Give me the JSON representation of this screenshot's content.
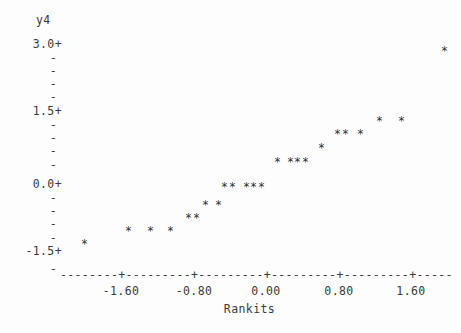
{
  "plot": {
    "type": "character-scatter",
    "marker_glyph": "*",
    "background_color": "#fdfdfd",
    "text_color": "#3a3a3a"
  },
  "y_axis": {
    "title": "y4",
    "major_labels": [
      "3.0+",
      "1.5+",
      "0.0+",
      "-1.5+"
    ],
    "minor_glyph": "-",
    "range": [
      -1.8,
      3.0
    ],
    "major_values": [
      3.0,
      1.5,
      0.0,
      -1.5
    ]
  },
  "x_axis": {
    "title": "Rankits",
    "tick_labels": [
      "-1.60",
      "-0.80",
      "0.00",
      "0.80",
      "1.60"
    ],
    "tick_values": [
      -1.6,
      -0.8,
      0.0,
      0.8,
      1.6
    ],
    "axis_line": "--------+---------+---------+---------+---------+-----",
    "range": [
      -2.27,
      1.95
    ]
  },
  "chart_data": {
    "type": "scatter",
    "title": "",
    "subtitle": "",
    "xlabel": "Rankits",
    "ylabel": "y4",
    "xlim": [
      -2.27,
      1.95
    ],
    "ylim": [
      -1.8,
      3.0
    ],
    "grid": false,
    "legend": "none",
    "xtick_labels": [
      "-1.60",
      "-0.80",
      "0.00",
      "0.80",
      "1.60"
    ],
    "ytick_labels": [
      "3.0+",
      "1.5+",
      "0.0+",
      "-1.5+"
    ],
    "n_points": 20,
    "series": [
      {
        "name": "y4 vs Rankits",
        "marker": "*",
        "points": [
          {
            "x": -2.01,
            "y": -1.52,
            "px": 84,
            "py": 245
          },
          {
            "x": -1.52,
            "y": -1.23,
            "px": 128,
            "py": 232
          },
          {
            "x": -1.28,
            "y": -1.23,
            "px": 150,
            "py": 232
          },
          {
            "x": -1.06,
            "y": -1.23,
            "px": 170,
            "py": 232
          },
          {
            "x": -0.86,
            "y": -0.93,
            "px": 188,
            "py": 219
          },
          {
            "x": -0.77,
            "y": -0.93,
            "px": 196,
            "py": 219
          },
          {
            "x": -0.67,
            "y": -0.63,
            "px": 205,
            "py": 206
          },
          {
            "x": -0.53,
            "y": -0.63,
            "px": 218,
            "py": 206
          },
          {
            "x": -0.46,
            "y": -0.2,
            "px": 224,
            "py": 188
          },
          {
            "x": -0.38,
            "y": -0.2,
            "px": 232,
            "py": 188
          },
          {
            "x": -0.22,
            "y": -0.2,
            "px": 246,
            "py": 188
          },
          {
            "x": -0.14,
            "y": -0.2,
            "px": 253,
            "py": 188
          },
          {
            "x": -0.06,
            "y": -0.2,
            "px": 261,
            "py": 188
          },
          {
            "x": 0.12,
            "y": 0.36,
            "px": 277,
            "py": 163
          },
          {
            "x": 0.26,
            "y": 0.36,
            "px": 290,
            "py": 163
          },
          {
            "x": 0.34,
            "y": 0.36,
            "px": 297,
            "py": 163
          },
          {
            "x": 0.43,
            "y": 0.36,
            "px": 305,
            "py": 163
          },
          {
            "x": 0.61,
            "y": 0.67,
            "px": 321,
            "py": 149
          },
          {
            "x": 0.78,
            "y": 0.98,
            "px": 337,
            "py": 135
          },
          {
            "x": 0.87,
            "y": 0.98,
            "px": 345,
            "py": 135
          },
          {
            "x": 1.04,
            "y": 0.98,
            "px": 360,
            "py": 135
          },
          {
            "x": 1.25,
            "y": 1.27,
            "px": 379,
            "py": 122
          },
          {
            "x": 1.49,
            "y": 1.27,
            "px": 401,
            "py": 122
          },
          {
            "x": 1.97,
            "y": 2.84,
            "px": 444,
            "py": 52
          }
        ]
      }
    ]
  },
  "y_axis_rows": [
    {
      "label": "3.0+",
      "py": 39,
      "major": true
    },
    {
      "label": "-",
      "py": 66,
      "major": false
    },
    {
      "label": "-",
      "py": 79,
      "major": false
    },
    {
      "label": "-",
      "py": 92,
      "major": false
    },
    {
      "label": "-",
      "py": 53,
      "major": false
    },
    {
      "label": "1.5+",
      "py": 106,
      "major": true
    },
    {
      "label": "-",
      "py": 120,
      "major": false
    },
    {
      "label": "-",
      "py": 133,
      "major": false
    },
    {
      "label": "-",
      "py": 146,
      "major": false
    },
    {
      "label": "-",
      "py": 160,
      "major": false
    },
    {
      "label": "0.0+",
      "py": 179,
      "major": true
    },
    {
      "label": "-",
      "py": 193,
      "major": false
    },
    {
      "label": "-",
      "py": 206,
      "major": false
    },
    {
      "label": "-",
      "py": 219,
      "major": false
    },
    {
      "label": "-",
      "py": 233,
      "major": false
    },
    {
      "label": "-1.5+",
      "py": 246,
      "major": true
    },
    {
      "label": "-",
      "py": 264,
      "major": false
    }
  ],
  "x_tick_positions": [
    {
      "label": "-1.60",
      "px": 121
    },
    {
      "label": "-0.80",
      "px": 194
    },
    {
      "label": "0.00",
      "px": 266
    },
    {
      "label": "0.80",
      "px": 339
    },
    {
      "label": "1.60",
      "px": 411
    }
  ]
}
